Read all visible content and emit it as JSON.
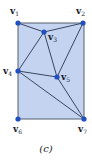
{
  "figure": {
    "caption": "(c)",
    "fill_color": "#c4d4f0",
    "border_color": "#555f70",
    "edge_color": "#2a3550",
    "vertex_color": "#1f4fc0",
    "rect": {
      "x": 18,
      "y": 23,
      "w": 66,
      "h": 96
    },
    "vertices": [
      {
        "id": "v1",
        "letter": "v",
        "sub": "1",
        "x": 18,
        "y": 23,
        "lx": 10,
        "ly": 14
      },
      {
        "id": "v2",
        "letter": "v",
        "sub": "2",
        "x": 83,
        "y": 23,
        "lx": 76,
        "ly": 14
      },
      {
        "id": "v3",
        "letter": "v",
        "sub": "3",
        "x": 44,
        "y": 32,
        "lx": 48,
        "ly": 40
      },
      {
        "id": "v4",
        "letter": "v",
        "sub": "4",
        "x": 18,
        "y": 71,
        "lx": 3,
        "ly": 74
      },
      {
        "id": "v5",
        "letter": "v",
        "sub": "5",
        "x": 57,
        "y": 77,
        "lx": 61,
        "ly": 80
      },
      {
        "id": "v6",
        "letter": "v",
        "sub": "6",
        "x": 18,
        "y": 119,
        "lx": 13,
        "ly": 132
      },
      {
        "id": "v7",
        "letter": "v",
        "sub": "7",
        "x": 84,
        "y": 119,
        "lx": 78,
        "ly": 132
      }
    ],
    "edges": [
      [
        "v1",
        "v3"
      ],
      [
        "v3",
        "v2"
      ],
      [
        "v2",
        "v5"
      ],
      [
        "v3",
        "v4"
      ],
      [
        "v3",
        "v5"
      ],
      [
        "v4",
        "v5"
      ],
      [
        "v4",
        "v7"
      ],
      [
        "v5",
        "v7"
      ]
    ]
  }
}
